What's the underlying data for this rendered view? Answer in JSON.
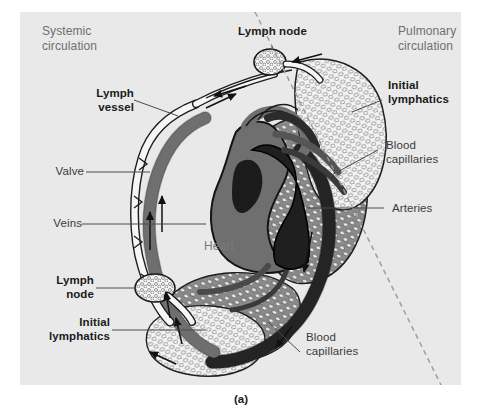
{
  "figure": {
    "caption": "(a)",
    "background_color": "#e9e9e9",
    "page_color": "#ffffff",
    "divider": {
      "name": "dashed-divider",
      "style": "dashed",
      "color": "#9a9a9a",
      "from": [
        255,
        12
      ],
      "to": [
        441,
        385
      ]
    }
  },
  "regions": [
    {
      "id": "systemic",
      "label": "Systemic\ncirculation",
      "x": 42,
      "y": 24
    },
    {
      "id": "pulmonary",
      "label": "Pulmonary\ncirculation",
      "x": 398,
      "y": 24
    }
  ],
  "labels": {
    "lymph_node_top": "Lymph node",
    "lymph_vessel": "Lymph\nvessel",
    "valve": "Valve",
    "veins": "Veins",
    "lymph_node_left": "Lymph\nnode",
    "initial_lymphatics_left": "Initial\nlymphatics",
    "initial_lymphatics_right": "Initial\nlymphatics",
    "blood_capillaries_right": "Blood\ncapillaries",
    "blood_capillaries_bottom": "Blood\ncapillaries",
    "arteries": "Arteries",
    "heart": "Heart"
  },
  "colors": {
    "artery_dark": "#2b2b2b",
    "vein_gray": "#6f6f6f",
    "capillary_mesh": "#555555",
    "lymph_white": "#f4f4f4",
    "outline": "#1a1a1a",
    "label_text": "#1a1a1a",
    "region_text": "#6e6e6e"
  }
}
